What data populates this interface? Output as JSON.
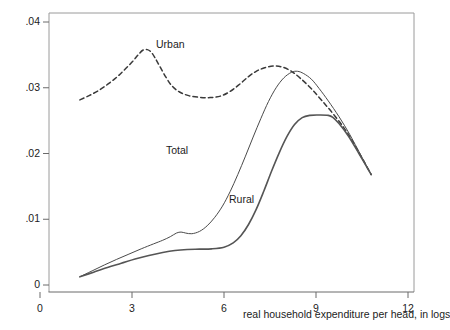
{
  "chart_data": {
    "type": "line",
    "title": "",
    "xlabel": "real household expenditure per head, in logs",
    "ylabel": "",
    "xlim": [
      -1.3,
      13.0
    ],
    "ylim": [
      -0.0022,
      0.0425
    ],
    "xticks": [
      0,
      3,
      6,
      9,
      12
    ],
    "xticklabels": [
      "0",
      "3",
      "6",
      "9",
      "12"
    ],
    "yticks": [
      0,
      0.01,
      0.02,
      0.03,
      0.04
    ],
    "yticklabels": [
      "0",
      ".01",
      ".02",
      ".03",
      ".04"
    ],
    "grid": false,
    "legend_position": "inline-annotations",
    "annotations": [
      {
        "text": "Urban",
        "x": 3.75,
        "y": 0.0352
      },
      {
        "text": "Total",
        "x": 4.1,
        "y": 0.0189
      },
      {
        "text": "Rural",
        "x": 6.18,
        "y": 0.0127
      }
    ],
    "series": [
      {
        "name": "Urban",
        "style": "dashed",
        "color": "#3a3a3a",
        "points": [
          [
            1.3,
            0.02815
          ],
          [
            1.6,
            0.0288
          ],
          [
            1.9,
            0.02955
          ],
          [
            2.2,
            0.0305
          ],
          [
            2.5,
            0.0316
          ],
          [
            2.75,
            0.0327
          ],
          [
            3.0,
            0.0339
          ],
          [
            3.2,
            0.035
          ],
          [
            3.35,
            0.0357
          ],
          [
            3.5,
            0.0358
          ],
          [
            3.62,
            0.03545
          ],
          [
            3.75,
            0.03455
          ],
          [
            3.9,
            0.0333
          ],
          [
            4.1,
            0.03165
          ],
          [
            4.3,
            0.0303
          ],
          [
            4.55,
            0.02935
          ],
          [
            4.85,
            0.0288
          ],
          [
            5.2,
            0.02855
          ],
          [
            5.55,
            0.0285
          ],
          [
            5.9,
            0.02875
          ],
          [
            6.2,
            0.02945
          ],
          [
            6.5,
            0.0305
          ],
          [
            6.8,
            0.0317
          ],
          [
            7.05,
            0.0325
          ],
          [
            7.3,
            0.033
          ],
          [
            7.6,
            0.0333
          ],
          [
            7.9,
            0.03315
          ],
          [
            8.2,
            0.0325
          ],
          [
            8.5,
            0.0314
          ],
          [
            8.85,
            0.02985
          ],
          [
            9.2,
            0.028
          ],
          [
            9.6,
            0.0258
          ],
          [
            10.0,
            0.0233
          ],
          [
            10.4,
            0.02015
          ],
          [
            10.8,
            0.0168
          ]
        ]
      },
      {
        "name": "Total",
        "style": "solid",
        "color": "#4a4a4a",
        "points": [
          [
            1.3,
            0.00125
          ],
          [
            1.7,
            0.00215
          ],
          [
            2.1,
            0.00305
          ],
          [
            2.5,
            0.0039
          ],
          [
            2.9,
            0.0047
          ],
          [
            3.3,
            0.0055
          ],
          [
            3.7,
            0.00625
          ],
          [
            4.0,
            0.0068
          ],
          [
            4.25,
            0.00735
          ],
          [
            4.45,
            0.0079
          ],
          [
            4.6,
            0.00805
          ],
          [
            4.75,
            0.0079
          ],
          [
            4.95,
            0.0078
          ],
          [
            5.2,
            0.00815
          ],
          [
            5.45,
            0.009
          ],
          [
            5.7,
            0.0103
          ],
          [
            5.95,
            0.012
          ],
          [
            6.2,
            0.0142
          ],
          [
            6.45,
            0.0168
          ],
          [
            6.7,
            0.0196
          ],
          [
            6.95,
            0.0225
          ],
          [
            7.2,
            0.0253
          ],
          [
            7.45,
            0.0279
          ],
          [
            7.7,
            0.03
          ],
          [
            7.95,
            0.0315
          ],
          [
            8.2,
            0.03235
          ],
          [
            8.4,
            0.0325
          ],
          [
            8.6,
            0.03215
          ],
          [
            8.85,
            0.0313
          ],
          [
            9.1,
            0.0299
          ],
          [
            9.4,
            0.028
          ],
          [
            9.75,
            0.0256
          ],
          [
            10.1,
            0.0229
          ],
          [
            10.45,
            0.01985
          ],
          [
            10.8,
            0.0168
          ]
        ]
      },
      {
        "name": "Rural",
        "style": "solid-thick",
        "color": "#555555",
        "points": [
          [
            1.3,
            0.00125
          ],
          [
            1.75,
            0.00195
          ],
          [
            2.2,
            0.00265
          ],
          [
            2.65,
            0.0033
          ],
          [
            3.1,
            0.00395
          ],
          [
            3.55,
            0.0045
          ],
          [
            4.0,
            0.00495
          ],
          [
            4.4,
            0.00525
          ],
          [
            4.8,
            0.0054
          ],
          [
            5.2,
            0.00545
          ],
          [
            5.6,
            0.0055
          ],
          [
            6.0,
            0.00575
          ],
          [
            6.3,
            0.0064
          ],
          [
            6.55,
            0.0075
          ],
          [
            6.8,
            0.0092
          ],
          [
            7.05,
            0.0115
          ],
          [
            7.3,
            0.0143
          ],
          [
            7.55,
            0.0173
          ],
          [
            7.8,
            0.0201
          ],
          [
            8.05,
            0.02255
          ],
          [
            8.3,
            0.0244
          ],
          [
            8.55,
            0.02545
          ],
          [
            8.8,
            0.0258
          ],
          [
            9.1,
            0.02585
          ],
          [
            9.4,
            0.0258
          ],
          [
            9.55,
            0.0255
          ],
          [
            9.75,
            0.02455
          ],
          [
            10.05,
            0.0227
          ],
          [
            10.4,
            0.02
          ],
          [
            10.8,
            0.0168
          ]
        ]
      }
    ]
  },
  "figure": {
    "top_clipped_text": ""
  }
}
